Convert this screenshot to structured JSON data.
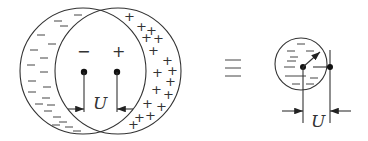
{
  "left_diagram": {
    "inner_charge_left": "−",
    "inner_charge_right": "+",
    "plus_sign": "+",
    "voltage_label": "U"
  },
  "equivalence_symbol": "≡",
  "right_diagram": {
    "voltage_label": "U"
  }
}
